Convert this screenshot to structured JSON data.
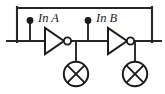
{
  "figure": {
    "type": "schematic",
    "width": 165,
    "height": 94,
    "background_color": "#ffffff",
    "line_color": "#1c1c1c"
  },
  "labels": {
    "input_a": "In A",
    "input_b": "In B"
  },
  "components": [
    {
      "id": "switch-node-a",
      "kind": "terminal-dot",
      "label": "In A",
      "x": 30,
      "y": 21
    },
    {
      "id": "switch-node-b",
      "kind": "terminal-dot",
      "label": "In B",
      "x": 88,
      "y": 21
    },
    {
      "id": "inverter-a",
      "kind": "not-gate",
      "label": "",
      "x": 45,
      "y": 41
    },
    {
      "id": "inverter-b",
      "kind": "not-gate",
      "label": "",
      "x": 108,
      "y": 41
    },
    {
      "id": "lamp-a",
      "kind": "lamp-indicator",
      "label": "",
      "x": 76,
      "y": 74
    },
    {
      "id": "lamp-b",
      "kind": "lamp-indicator",
      "label": "",
      "x": 135,
      "y": 74
    }
  ],
  "wires": {
    "top_rail": {
      "x1": 17,
      "y1": 8,
      "x2": 152,
      "y2": 8
    },
    "main_rail": {
      "x1": 8,
      "y1": 41,
      "x2": 160,
      "y2": 41
    },
    "left_riser": {
      "x": 17,
      "y1": 8,
      "y2": 41
    },
    "right_riser": {
      "x": 152,
      "y1": 8,
      "y2": 41
    },
    "stub_a": {
      "x": 30,
      "y1": 21,
      "y2": 41
    },
    "stub_b": {
      "x": 88,
      "y1": 21,
      "y2": 41
    },
    "drop_lamp_a": {
      "x": 76,
      "y1": 41,
      "y2": 61
    },
    "drop_lamp_b": {
      "x": 135,
      "y1": 41,
      "y2": 61
    }
  },
  "icons": {
    "not_gate": "inverter-triangle-with-bubble-icon",
    "lamp": "lamp-circle-cross-icon",
    "junction": "junction-dot-icon"
  }
}
